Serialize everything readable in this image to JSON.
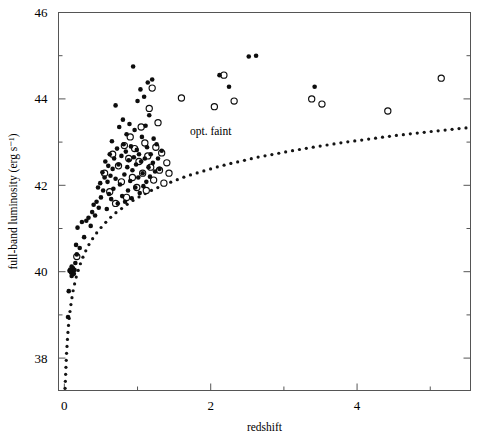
{
  "figure": {
    "width": 477,
    "height": 434,
    "background": "#ffffff",
    "ink_color": "#0d0d0d",
    "frame_color": "#555555"
  },
  "chart_data": {
    "type": "scatter",
    "title": "",
    "xlabel": "redshift",
    "ylabel": "full-band luminosity (erg s⁻¹)",
    "xlim": [
      -0.08,
      5.55
    ],
    "ylim": [
      37.25,
      46.0
    ],
    "grid": false,
    "legend": "none",
    "x_major_ticks": [
      0,
      2,
      4
    ],
    "x_major_tick_labels": [
      "0",
      "2",
      "4"
    ],
    "x_minor_ticks": [
      1,
      3,
      5
    ],
    "y_major_ticks": [
      38,
      40,
      42,
      44,
      46
    ],
    "y_major_tick_labels": [
      "38",
      "40",
      "42",
      "44",
      "46"
    ],
    "y_minor_ticks": [
      39,
      41,
      43,
      45
    ],
    "annotations": [
      {
        "text": "opt. faint",
        "x": 2.0,
        "y": 43.17
      }
    ],
    "series": [
      {
        "name": "filled-circles",
        "marker": "filled-circle",
        "marker_size": 4.6,
        "color": "#0d0d0d",
        "points": [
          [
            0.05,
            38.95
          ],
          [
            0.06,
            39.55
          ],
          [
            0.07,
            40.02
          ],
          [
            0.08,
            40.05
          ],
          [
            0.09,
            39.98
          ],
          [
            0.1,
            40.12
          ],
          [
            0.1,
            39.9
          ],
          [
            0.11,
            40.0
          ],
          [
            0.12,
            40.08
          ],
          [
            0.13,
            39.95
          ],
          [
            0.14,
            40.04
          ],
          [
            0.15,
            40.2
          ],
          [
            0.16,
            40.62
          ],
          [
            0.17,
            40.4
          ],
          [
            0.18,
            41.02
          ],
          [
            0.21,
            40.55
          ],
          [
            0.24,
            41.15
          ],
          [
            0.27,
            40.8
          ],
          [
            0.3,
            41.18
          ],
          [
            0.33,
            41.25
          ],
          [
            0.36,
            41.06
          ],
          [
            0.38,
            41.38
          ],
          [
            0.4,
            41.55
          ],
          [
            0.42,
            41.3
          ],
          [
            0.44,
            41.62
          ],
          [
            0.46,
            41.95
          ],
          [
            0.47,
            41.48
          ],
          [
            0.49,
            42.05
          ],
          [
            0.5,
            41.72
          ],
          [
            0.52,
            42.3
          ],
          [
            0.53,
            41.88
          ],
          [
            0.55,
            42.18
          ],
          [
            0.56,
            42.55
          ],
          [
            0.58,
            41.45
          ],
          [
            0.59,
            42.08
          ],
          [
            0.6,
            42.45
          ],
          [
            0.61,
            41.8
          ],
          [
            0.62,
            42.72
          ],
          [
            0.63,
            42.22
          ],
          [
            0.64,
            41.68
          ],
          [
            0.65,
            43.02
          ],
          [
            0.66,
            42.38
          ],
          [
            0.67,
            41.92
          ],
          [
            0.68,
            42.62
          ],
          [
            0.7,
            43.85
          ],
          [
            0.7,
            42.15
          ],
          [
            0.72,
            42.85
          ],
          [
            0.73,
            41.58
          ],
          [
            0.74,
            42.48
          ],
          [
            0.75,
            43.35
          ],
          [
            0.76,
            42.02
          ],
          [
            0.78,
            42.68
          ],
          [
            0.79,
            41.75
          ],
          [
            0.8,
            43.52
          ],
          [
            0.81,
            42.95
          ],
          [
            0.82,
            42.25
          ],
          [
            0.83,
            41.62
          ],
          [
            0.84,
            42.78
          ],
          [
            0.85,
            43.18
          ],
          [
            0.86,
            42.42
          ],
          [
            0.87,
            41.88
          ],
          [
            0.88,
            42.58
          ],
          [
            0.89,
            43.42
          ],
          [
            0.9,
            42.1
          ],
          [
            0.91,
            42.9
          ],
          [
            0.92,
            41.7
          ],
          [
            0.93,
            42.35
          ],
          [
            0.94,
            44.75
          ],
          [
            0.95,
            42.65
          ],
          [
            0.96,
            43.28
          ],
          [
            0.97,
            41.95
          ],
          [
            0.98,
            42.48
          ],
          [
            0.99,
            42.82
          ],
          [
            1.0,
            43.95
          ],
          [
            1.01,
            42.18
          ],
          [
            1.02,
            42.72
          ],
          [
            1.03,
            41.82
          ],
          [
            1.04,
            44.22
          ],
          [
            1.05,
            42.55
          ],
          [
            1.06,
            43.12
          ],
          [
            1.07,
            42.28
          ],
          [
            1.08,
            41.98
          ],
          [
            1.09,
            44.05
          ],
          [
            1.1,
            42.62
          ],
          [
            1.11,
            43.38
          ],
          [
            1.12,
            42.08
          ],
          [
            1.13,
            42.88
          ],
          [
            1.14,
            44.38
          ],
          [
            1.15,
            42.42
          ],
          [
            1.16,
            43.62
          ],
          [
            1.17,
            42.2
          ],
          [
            1.18,
            42.72
          ],
          [
            1.2,
            44.45
          ],
          [
            1.21,
            42.52
          ],
          [
            1.22,
            43.08
          ],
          [
            1.24,
            42.32
          ],
          [
            1.26,
            42.95
          ],
          [
            1.28,
            42.62
          ],
          [
            1.3,
            42.38
          ],
          [
            1.33,
            42.8
          ],
          [
            2.12,
            44.55
          ],
          [
            2.25,
            44.28
          ],
          [
            2.52,
            44.98
          ],
          [
            2.62,
            45.0
          ],
          [
            3.42,
            44.28
          ]
        ]
      },
      {
        "name": "open-circles",
        "marker": "open-circle",
        "marker_size": 6.2,
        "color": "#0d0d0d",
        "points": [
          [
            0.17,
            40.35
          ],
          [
            0.55,
            42.28
          ],
          [
            0.62,
            41.85
          ],
          [
            0.66,
            42.72
          ],
          [
            0.7,
            41.58
          ],
          [
            0.74,
            42.45
          ],
          [
            0.78,
            42.08
          ],
          [
            0.82,
            42.92
          ],
          [
            0.85,
            41.72
          ],
          [
            0.88,
            42.62
          ],
          [
            0.9,
            43.12
          ],
          [
            0.93,
            42.18
          ],
          [
            0.96,
            42.85
          ],
          [
            0.99,
            41.95
          ],
          [
            1.02,
            42.55
          ],
          [
            1.05,
            43.35
          ],
          [
            1.07,
            42.28
          ],
          [
            1.1,
            42.98
          ],
          [
            1.12,
            41.88
          ],
          [
            1.14,
            42.68
          ],
          [
            1.16,
            43.78
          ],
          [
            1.18,
            42.42
          ],
          [
            1.2,
            44.25
          ],
          [
            1.22,
            42.12
          ],
          [
            1.25,
            42.88
          ],
          [
            1.28,
            43.45
          ],
          [
            1.3,
            42.35
          ],
          [
            1.33,
            42.75
          ],
          [
            1.36,
            42.05
          ],
          [
            1.4,
            42.52
          ],
          [
            1.43,
            42.28
          ],
          [
            1.6,
            44.02
          ],
          [
            2.05,
            43.82
          ],
          [
            2.18,
            44.55
          ],
          [
            2.32,
            43.95
          ],
          [
            3.38,
            44.0
          ],
          [
            3.52,
            43.88
          ],
          [
            4.42,
            43.72
          ],
          [
            5.15,
            44.48
          ]
        ]
      }
    ],
    "curves": [
      {
        "name": "sensitivity-limit",
        "style": "dotted",
        "color": "#141414",
        "description": "flux-limit curve rising with redshift",
        "points": [
          [
            0.01,
            37.3
          ],
          [
            0.02,
            37.72
          ],
          [
            0.03,
            38.1
          ],
          [
            0.04,
            38.38
          ],
          [
            0.05,
            38.62
          ],
          [
            0.06,
            38.82
          ],
          [
            0.07,
            38.98
          ],
          [
            0.08,
            39.12
          ],
          [
            0.1,
            39.36
          ],
          [
            0.12,
            39.56
          ],
          [
            0.14,
            39.72
          ],
          [
            0.16,
            39.86
          ],
          [
            0.18,
            39.98
          ],
          [
            0.21,
            40.14
          ],
          [
            0.24,
            40.28
          ],
          [
            0.27,
            40.4
          ],
          [
            0.3,
            40.51
          ],
          [
            0.34,
            40.64
          ],
          [
            0.38,
            40.75
          ],
          [
            0.42,
            40.85
          ],
          [
            0.47,
            40.96
          ],
          [
            0.52,
            41.06
          ],
          [
            0.58,
            41.17
          ],
          [
            0.64,
            41.27
          ],
          [
            0.7,
            41.36
          ],
          [
            0.78,
            41.46
          ],
          [
            0.86,
            41.56
          ],
          [
            0.94,
            41.65
          ],
          [
            1.04,
            41.75
          ],
          [
            1.14,
            41.84
          ],
          [
            1.24,
            41.92
          ],
          [
            1.36,
            42.01
          ],
          [
            1.48,
            42.09
          ],
          [
            1.62,
            42.18
          ],
          [
            1.76,
            42.26
          ],
          [
            1.92,
            42.34
          ],
          [
            2.08,
            42.42
          ],
          [
            2.26,
            42.5
          ],
          [
            2.44,
            42.57
          ],
          [
            2.64,
            42.65
          ],
          [
            2.86,
            42.72
          ],
          [
            3.08,
            42.79
          ],
          [
            3.32,
            42.86
          ],
          [
            3.58,
            42.93
          ],
          [
            3.84,
            43.0
          ],
          [
            4.12,
            43.06
          ],
          [
            4.42,
            43.13
          ],
          [
            4.72,
            43.19
          ],
          [
            5.04,
            43.25
          ],
          [
            5.38,
            43.31
          ],
          [
            5.5,
            43.33
          ]
        ]
      }
    ]
  }
}
